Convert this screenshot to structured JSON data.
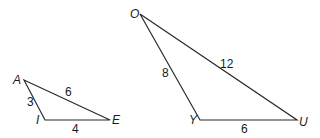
{
  "diagram": {
    "triangles": [
      {
        "name": "AIE",
        "vertices": {
          "A": {
            "label": "A",
            "x": 24,
            "y": 80
          },
          "I": {
            "label": "I",
            "x": 45,
            "y": 120
          },
          "E": {
            "label": "E",
            "x": 110,
            "y": 120
          }
        },
        "sides": {
          "AI": "3",
          "AE": "6",
          "IE": "4"
        }
      },
      {
        "name": "OYU",
        "vertices": {
          "O": {
            "label": "O",
            "x": 140,
            "y": 14
          },
          "Y": {
            "label": "Y",
            "x": 200,
            "y": 120
          },
          "U": {
            "label": "U",
            "x": 297,
            "y": 120
          }
        },
        "sides": {
          "OY": "8",
          "OU": "12",
          "YU": "6"
        }
      }
    ]
  }
}
